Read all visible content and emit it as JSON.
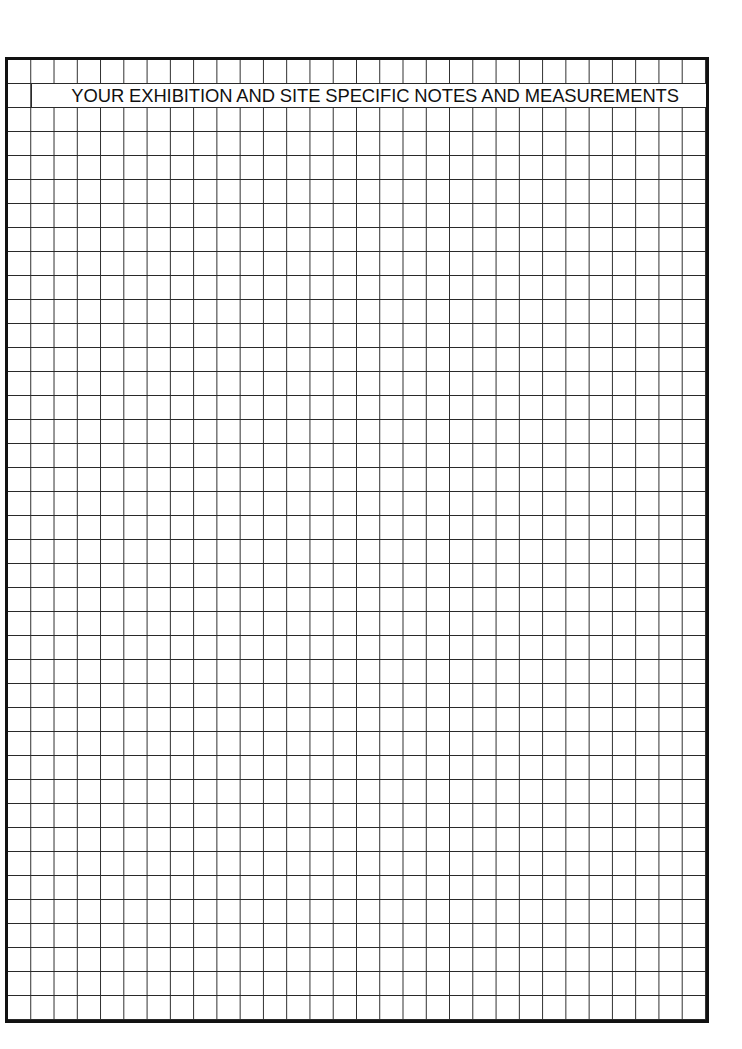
{
  "document": {
    "type": "grid-worksheet",
    "title": "YOUR EXHIBITION AND SITE SPECIFIC NOTES AND MEASUREMENTS",
    "grid": {
      "columns": 30,
      "rows": 40,
      "title_row": 2,
      "title_span_columns": [
        2,
        30
      ],
      "line_color": "#2a2a2a",
      "border_color": "#111111",
      "background": "#ffffff"
    }
  }
}
